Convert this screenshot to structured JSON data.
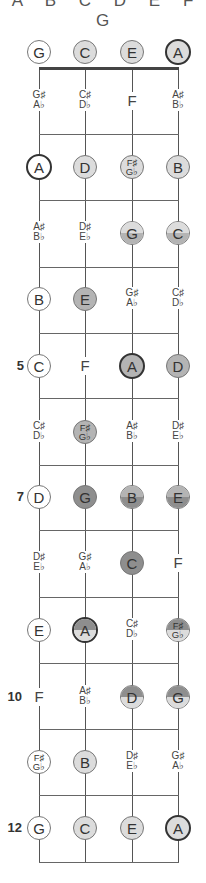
{
  "header": {
    "notes_label": "A B C D E F G"
  },
  "colors": {
    "white": "#ffffff",
    "light": "#dcdcdc",
    "medium": "#b4b4b4",
    "dark": "#8e8e8e",
    "line": "#666666"
  },
  "strings_x": [
    39,
    85,
    132,
    178
  ],
  "fret_lines_y": [
    134,
    200,
    267,
    333,
    398,
    465,
    530,
    597,
    663,
    729,
    795,
    862
  ],
  "nut_y": 67,
  "fret_numbers": [
    {
      "fret": 5,
      "label": "5",
      "y": 366
    },
    {
      "fret": 7,
      "label": "7",
      "y": 497
    },
    {
      "fret": 10,
      "label": "10",
      "y": 697
    },
    {
      "fret": 12,
      "label": "12",
      "y": 828
    }
  ],
  "rows": [
    {
      "fret": 0,
      "y": 52,
      "notes": [
        {
          "l1": "G",
          "style": "circle",
          "fill": "white"
        },
        {
          "l1": "C",
          "style": "circle",
          "fill": "light"
        },
        {
          "l1": "E",
          "style": "circle",
          "fill": "light"
        },
        {
          "l1": "A",
          "style": "circle",
          "fill": "light",
          "root": true
        }
      ]
    },
    {
      "fret": 1,
      "y": 101,
      "notes": [
        {
          "l1": "G♯",
          "l2": "A♭",
          "style": "text"
        },
        {
          "l1": "C♯",
          "l2": "D♭",
          "style": "text"
        },
        {
          "l1": "F",
          "style": "text"
        },
        {
          "l1": "A♯",
          "l2": "B♭",
          "style": "text"
        }
      ]
    },
    {
      "fret": 2,
      "y": 167,
      "notes": [
        {
          "l1": "A",
          "style": "circle",
          "fill": "white",
          "root": true
        },
        {
          "l1": "D",
          "style": "circle",
          "fill": "light"
        },
        {
          "l1": "F♯",
          "l2": "G♭",
          "style": "circle",
          "fill": "light"
        },
        {
          "l1": "B",
          "style": "circle",
          "fill": "light"
        }
      ]
    },
    {
      "fret": 3,
      "y": 233,
      "notes": [
        {
          "l1": "A♯",
          "l2": "B♭",
          "style": "text"
        },
        {
          "l1": "D♯",
          "l2": "E♭",
          "style": "text"
        },
        {
          "l1": "G",
          "style": "circle",
          "fill": "split",
          "top": "light",
          "bottom": "medium"
        },
        {
          "l1": "C",
          "style": "circle",
          "fill": "split",
          "top": "light",
          "bottom": "medium"
        }
      ]
    },
    {
      "fret": 4,
      "y": 299,
      "notes": [
        {
          "l1": "B",
          "style": "circle",
          "fill": "white"
        },
        {
          "l1": "E",
          "style": "circle",
          "fill": "medium"
        },
        {
          "l1": "G♯",
          "l2": "A♭",
          "style": "text"
        },
        {
          "l1": "C♯",
          "l2": "D♭",
          "style": "text"
        }
      ]
    },
    {
      "fret": 5,
      "y": 366,
      "notes": [
        {
          "l1": "C",
          "style": "circle",
          "fill": "white"
        },
        {
          "l1": "F",
          "style": "text"
        },
        {
          "l1": "A",
          "style": "circle",
          "fill": "medium",
          "root": true
        },
        {
          "l1": "D",
          "style": "circle",
          "fill": "medium"
        }
      ]
    },
    {
      "fret": 6,
      "y": 432,
      "notes": [
        {
          "l1": "C♯",
          "l2": "D♭",
          "style": "text"
        },
        {
          "l1": "F♯",
          "l2": "G♭",
          "style": "circle",
          "fill": "medium"
        },
        {
          "l1": "A♯",
          "l2": "B♭",
          "style": "text"
        },
        {
          "l1": "D♯",
          "l2": "E♭",
          "style": "text"
        }
      ]
    },
    {
      "fret": 7,
      "y": 497,
      "notes": [
        {
          "l1": "D",
          "style": "circle",
          "fill": "white"
        },
        {
          "l1": "G",
          "style": "circle",
          "fill": "dark"
        },
        {
          "l1": "B",
          "style": "circle",
          "fill": "split",
          "top": "medium",
          "bottom": "dark"
        },
        {
          "l1": "E",
          "style": "circle",
          "fill": "split",
          "top": "medium",
          "bottom": "dark"
        }
      ]
    },
    {
      "fret": 8,
      "y": 563,
      "notes": [
        {
          "l1": "D♯",
          "l2": "E♭",
          "style": "text"
        },
        {
          "l1": "G♯",
          "l2": "A♭",
          "style": "text"
        },
        {
          "l1": "C",
          "style": "circle",
          "fill": "dark"
        },
        {
          "l1": "F",
          "style": "text"
        }
      ]
    },
    {
      "fret": 9,
      "y": 630,
      "notes": [
        {
          "l1": "E",
          "style": "circle",
          "fill": "white"
        },
        {
          "l1": "A",
          "style": "circle",
          "fill": "split",
          "top": "dark",
          "bottom": "light",
          "root": true
        },
        {
          "l1": "C♯",
          "l2": "D♭",
          "style": "text"
        },
        {
          "l1": "F♯",
          "l2": "G♭",
          "style": "circle",
          "fill": "split",
          "top": "dark",
          "bottom": "light"
        }
      ]
    },
    {
      "fret": 10,
      "y": 697,
      "notes": [
        {
          "l1": "F",
          "style": "text"
        },
        {
          "l1": "A♯",
          "l2": "B♭",
          "style": "text"
        },
        {
          "l1": "D",
          "style": "circle",
          "fill": "split",
          "top": "dark",
          "bottom": "light"
        },
        {
          "l1": "G",
          "style": "circle",
          "fill": "split",
          "top": "dark",
          "bottom": "light"
        }
      ]
    },
    {
      "fret": 11,
      "y": 762,
      "notes": [
        {
          "l1": "F♯",
          "l2": "G♭",
          "style": "circle",
          "fill": "white"
        },
        {
          "l1": "B",
          "style": "circle",
          "fill": "light"
        },
        {
          "l1": "D♯",
          "l2": "E♭",
          "style": "text"
        },
        {
          "l1": "G♯",
          "l2": "A♭",
          "style": "text"
        }
      ]
    },
    {
      "fret": 12,
      "y": 828,
      "notes": [
        {
          "l1": "G",
          "style": "circle",
          "fill": "white"
        },
        {
          "l1": "C",
          "style": "circle",
          "fill": "light"
        },
        {
          "l1": "E",
          "style": "circle",
          "fill": "light"
        },
        {
          "l1": "A",
          "style": "circle",
          "fill": "light",
          "root": true
        }
      ]
    }
  ]
}
